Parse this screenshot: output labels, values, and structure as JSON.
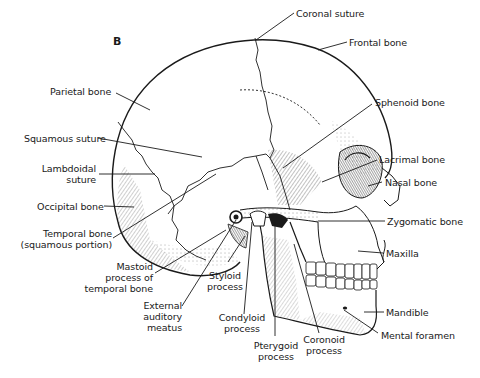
{
  "figure": {
    "panel_letter": "B"
  },
  "labels": {
    "coronal_suture": "Coronal suture",
    "frontal_bone": "Frontal bone",
    "parietal_bone": "Parietal bone",
    "sphenoid_bone": "Sphenoid bone",
    "squamous_suture": "Squamous suture",
    "lambdoidal_suture_1": "Lambdoidal",
    "lambdoidal_suture_2": "suture",
    "lacrimal_bone": "Lacrimal bone",
    "nasal_bone": "Nasal bone",
    "occipital_bone": "Occipital bone",
    "zygomatic_bone": "Zygomatic bone",
    "temporal_bone_1": "Temporal bone",
    "temporal_bone_2": "(squamous portion)",
    "maxilla": "Maxilla",
    "mastoid_1": "Mastoid",
    "mastoid_2": "process of",
    "mastoid_3": "temporal bone",
    "styloid_1": "Styloid",
    "styloid_2": "process",
    "ext_auditory_1": "External",
    "ext_auditory_2": "auditory",
    "ext_auditory_3": "meatus",
    "condyloid_1": "Condyloid",
    "condyloid_2": "process",
    "pterygoid_1": "Pterygoid",
    "pterygoid_2": "process",
    "coronoid_1": "Coronoid",
    "coronoid_2": "process",
    "mandible": "Mandible",
    "mental_foramen": "Mental foramen"
  },
  "colors": {
    "ink": "#1a1a1a",
    "background": "#ffffff"
  }
}
